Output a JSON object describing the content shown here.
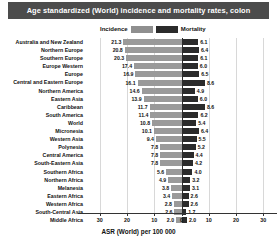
{
  "title": "Age standardized (World) incidence and mortality rates, colon",
  "legend": {
    "incidence_label": "Incidence",
    "mortality_label": "Mortality",
    "incidence_color": "#9a9a9a",
    "mortality_color": "#2b2b2b",
    "position": "top-center"
  },
  "axis": {
    "xlabel": "ASR (World) per 100 000",
    "ticks": [
      "30",
      "20",
      "10",
      "0",
      "10",
      "20",
      "30"
    ],
    "tick_values": [
      30,
      20,
      10,
      0,
      10,
      20,
      30
    ],
    "max": 35,
    "grid": true
  },
  "chart_data": {
    "type": "bar",
    "orientation": "horizontal-diverging",
    "title": "Age standardized (World) incidence and mortality rates, colon",
    "xlabel": "ASR (World) per 100 000",
    "ylabel": "",
    "xlim": [
      -35,
      35
    ],
    "grid": true,
    "legend_position": "top-center",
    "categories": [
      "Australia and New Zealand",
      "Northern Europe",
      "Southern Europe",
      "Europe Western",
      "Europe",
      "Central and Eastern Europe",
      "Northern America",
      "Eastern Asia",
      "Caribbean",
      "South America",
      "World",
      "Micronesia",
      "Western Asia",
      "Polynesia",
      "Central America",
      "South-Eastern Asia",
      "Southern Africa",
      "Northern Africa",
      "Melanesia",
      "Eastern Africa",
      "Western Africa",
      "South-Central Asia",
      "Middle Africa"
    ],
    "series": [
      {
        "name": "Incidence",
        "color": "#9a9a9a",
        "direction": "left",
        "values": [
          21.3,
          20.8,
          20.3,
          17.4,
          16.9,
          16.1,
          14.6,
          13.9,
          11.7,
          11.4,
          10.8,
          10.1,
          9.4,
          7.8,
          7.8,
          7.8,
          5.6,
          4.9,
          3.8,
          3.4,
          2.8,
          2.6,
          2.0
        ]
      },
      {
        "name": "Mortality",
        "color": "#2b2b2b",
        "direction": "right",
        "values": [
          6.1,
          6.4,
          6.1,
          6.0,
          6.5,
          8.6,
          4.9,
          6.0,
          8.6,
          6.2,
          5.4,
          6.4,
          5.5,
          5.2,
          4.4,
          4.2,
          4.0,
          3.2,
          3.1,
          2.6,
          2.6,
          1.7,
          2.0
        ]
      }
    ]
  }
}
